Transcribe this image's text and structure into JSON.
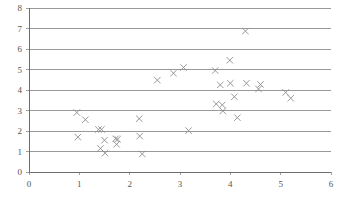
{
  "chart_data": {
    "type": "scatter",
    "title": "",
    "subtitle": "",
    "xlabel": "",
    "ylabel": "",
    "xlim": [
      0,
      6
    ],
    "ylim": [
      0,
      8
    ],
    "xticks": [
      0,
      1,
      2,
      3,
      4,
      5,
      6
    ],
    "yticks": [
      0,
      1,
      2,
      3,
      4,
      5,
      6,
      7,
      8
    ],
    "xtick_labels": [
      "0",
      "1",
      "2",
      "3",
      "4",
      "5",
      "6"
    ],
    "ytick_labels": [
      "0",
      "1",
      "2",
      "3",
      "4",
      "5",
      "6",
      "7",
      "8"
    ],
    "grid": {
      "horizontal": true,
      "vertical": false,
      "color": "#808080"
    },
    "legend": {
      "visible": false,
      "position": "none",
      "entries": []
    },
    "marker": {
      "symbol": "x",
      "color": "#8c8c8c",
      "size": 4
    },
    "series": [
      {
        "name": "series-1",
        "points": [
          {
            "x": 0.95,
            "y": 2.9
          },
          {
            "x": 0.97,
            "y": 1.7
          },
          {
            "x": 1.12,
            "y": 2.55
          },
          {
            "x": 1.38,
            "y": 2.07
          },
          {
            "x": 1.44,
            "y": 2.08
          },
          {
            "x": 1.42,
            "y": 1.15
          },
          {
            "x": 1.5,
            "y": 1.55
          },
          {
            "x": 1.51,
            "y": 0.92
          },
          {
            "x": 1.72,
            "y": 1.62
          },
          {
            "x": 1.76,
            "y": 1.6
          },
          {
            "x": 1.74,
            "y": 1.35
          },
          {
            "x": 2.19,
            "y": 2.6
          },
          {
            "x": 2.2,
            "y": 1.75
          },
          {
            "x": 2.25,
            "y": 0.88
          },
          {
            "x": 2.55,
            "y": 4.48
          },
          {
            "x": 2.87,
            "y": 4.82
          },
          {
            "x": 3.07,
            "y": 5.1
          },
          {
            "x": 3.17,
            "y": 2.02
          },
          {
            "x": 3.7,
            "y": 4.95
          },
          {
            "x": 3.72,
            "y": 3.32
          },
          {
            "x": 3.8,
            "y": 4.25
          },
          {
            "x": 3.84,
            "y": 3.27
          },
          {
            "x": 3.85,
            "y": 2.98
          },
          {
            "x": 3.99,
            "y": 5.45
          },
          {
            "x": 4.0,
            "y": 4.33
          },
          {
            "x": 4.08,
            "y": 3.67
          },
          {
            "x": 4.14,
            "y": 2.65
          },
          {
            "x": 4.3,
            "y": 6.87
          },
          {
            "x": 4.32,
            "y": 4.33
          },
          {
            "x": 4.56,
            "y": 4.05
          },
          {
            "x": 4.6,
            "y": 4.27
          },
          {
            "x": 5.1,
            "y": 3.88
          },
          {
            "x": 5.2,
            "y": 3.6
          }
        ]
      }
    ],
    "point_count": 33
  },
  "plot_geometry": {
    "left_px": 29,
    "right_px": 331,
    "top_px": 8,
    "bottom_px": 172
  }
}
